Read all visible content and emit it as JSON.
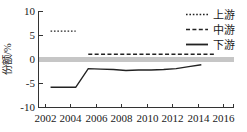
{
  "chart_data": {
    "type": "line",
    "title": "",
    "xlabel": "",
    "ylabel": "份额/%",
    "xlim": [
      2001,
      2016.6
    ],
    "ylim": [
      -10,
      10
    ],
    "xticks": [
      2002,
      2004,
      2006,
      2008,
      2010,
      2012,
      2014,
      2016
    ],
    "yticks": [
      10,
      5,
      0,
      -5,
      -10
    ],
    "xtick_labels": [
      "2002",
      "2004",
      "2006",
      "2008",
      "2010",
      "2012",
      "2014",
      "2016"
    ],
    "ytick_labels": [
      "10",
      "5",
      "0",
      "-5",
      "-10"
    ],
    "grid": false,
    "legend_position": "top-right",
    "zero_reference_line": {
      "value": 0,
      "color": "#c6c6c6",
      "width": 5
    },
    "series": [
      {
        "name": "上游",
        "style": "dotted",
        "color": "#222222",
        "x": [
          2002,
          2003,
          2004
        ],
        "values": [
          5.8,
          5.8,
          5.8
        ]
      },
      {
        "name": "中游",
        "style": "dashed",
        "color": "#222222",
        "x": [
          2005,
          2006,
          2007,
          2008,
          2009,
          2010,
          2011,
          2012,
          2013,
          2014,
          2015
        ],
        "values": [
          1.0,
          1.0,
          1.0,
          1.0,
          1.0,
          1.0,
          1.0,
          1.0,
          1.0,
          1.0,
          1.0
        ]
      },
      {
        "name": "下游",
        "style": "solid",
        "color": "#222222",
        "x": [
          2002,
          2003,
          2004,
          2005,
          2006,
          2007,
          2008,
          2009,
          2010,
          2011,
          2012,
          2013,
          2014
        ],
        "values": [
          -5.9,
          -5.9,
          -5.9,
          -2.0,
          -2.1,
          -2.2,
          -2.4,
          -2.3,
          -2.3,
          -2.2,
          -2.0,
          -1.6,
          -1.2
        ]
      }
    ]
  },
  "legend": {
    "entries": [
      {
        "label": "上游",
        "style": "dotted"
      },
      {
        "label": "中游",
        "style": "dashed"
      },
      {
        "label": "下游",
        "style": "solid"
      }
    ]
  },
  "axes": {
    "y_title": "份额/%"
  }
}
